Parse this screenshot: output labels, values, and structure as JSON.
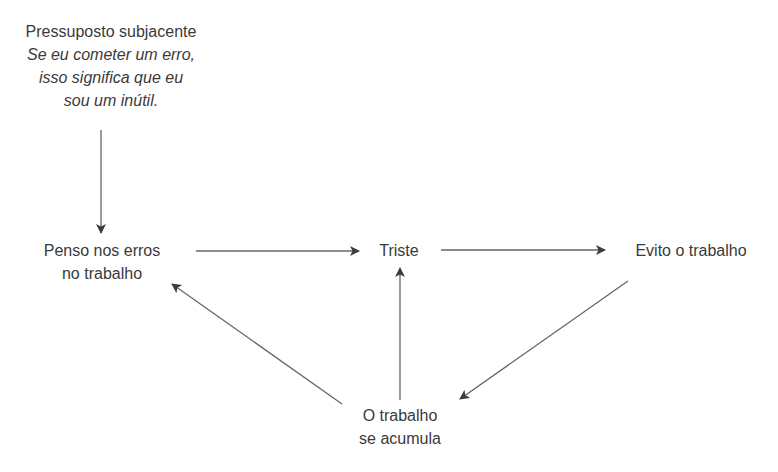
{
  "diagram": {
    "type": "cognitive-cycle",
    "nodes": {
      "assumption": {
        "title": "Pressuposto subjacente",
        "lines": [
          "Se eu cometer um erro,",
          "isso significa que eu",
          "sou um inútil."
        ]
      },
      "think": {
        "lines": [
          "Penso nos erros",
          "no trabalho"
        ]
      },
      "sad": {
        "label": "Triste"
      },
      "avoid": {
        "label": "Evito o trabalho"
      },
      "accumulate": {
        "lines": [
          "O trabalho",
          "se acumula"
        ]
      }
    },
    "edges": [
      {
        "from": "assumption",
        "to": "think"
      },
      {
        "from": "think",
        "to": "sad"
      },
      {
        "from": "sad",
        "to": "avoid"
      },
      {
        "from": "avoid",
        "to": "accumulate"
      },
      {
        "from": "accumulate",
        "to": "sad"
      },
      {
        "from": "accumulate",
        "to": "think"
      }
    ],
    "colors": {
      "text": "#3a3a3a",
      "arrow": "#555555",
      "background": "#ffffff"
    }
  }
}
